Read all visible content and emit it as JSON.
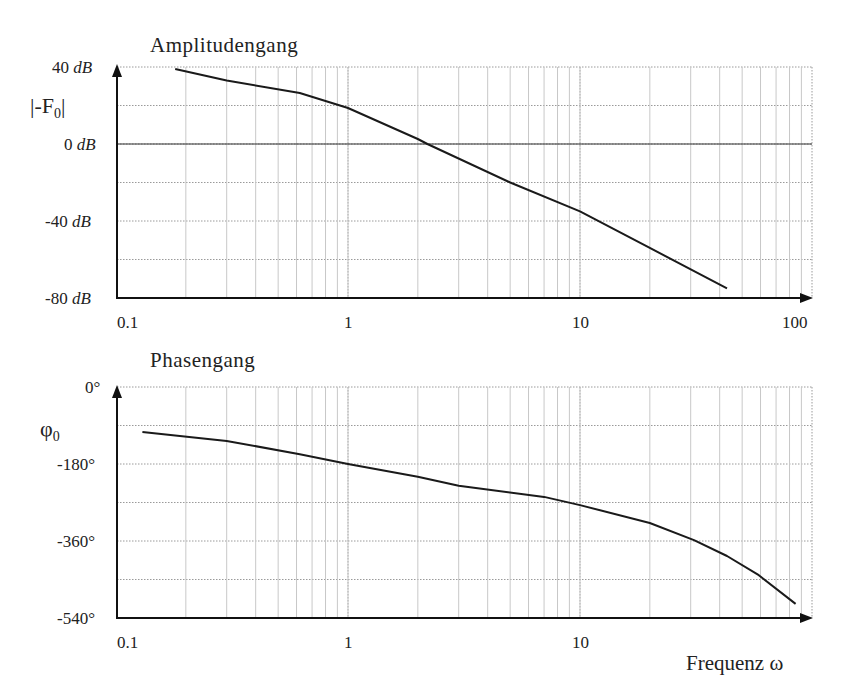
{
  "chart_data": [
    {
      "type": "line",
      "title": "Amplitudengang",
      "xlabel": "",
      "ylabel": "|-F0|",
      "xscale": "log",
      "xlim": [
        0.1,
        100
      ],
      "ylim": [
        -80,
        40
      ],
      "x_ticks": [
        "0.1",
        "1",
        "10",
        "100"
      ],
      "y_ticks": [
        "40 dB",
        "0 dB",
        "-40 dB",
        "-80 dB"
      ],
      "y_grid_step": 20,
      "grid": true,
      "series": [
        {
          "name": "|-F0| (dB)",
          "x": [
            0.18,
            0.3,
            0.62,
            1,
            2,
            2.2,
            5,
            10,
            20,
            43
          ],
          "values": [
            39,
            33,
            26.5,
            18.7,
            2.6,
            0,
            -20,
            -35,
            -54,
            -75
          ]
        }
      ]
    },
    {
      "type": "line",
      "title": "Phasengang",
      "xlabel": "Frequenz ω",
      "ylabel": "φ0",
      "xscale": "log",
      "xlim": [
        0.1,
        100
      ],
      "ylim": [
        -540,
        0
      ],
      "x_ticks": [
        "0.1",
        "1",
        "10"
      ],
      "y_ticks": [
        "0°",
        "-180°",
        "-360°",
        "-540°"
      ],
      "y_grid_step": 90,
      "grid": true,
      "series": [
        {
          "name": "φ0 (deg)",
          "x": [
            0.13,
            0.3,
            0.62,
            1,
            2,
            3,
            7,
            10,
            20,
            31,
            43,
            59,
            85
          ],
          "values": [
            -105,
            -126,
            -157,
            -180,
            -210,
            -231,
            -257,
            -276,
            -318,
            -358,
            -395,
            -440,
            -507
          ]
        }
      ]
    }
  ],
  "labels": {
    "amp_title": "Amplitudengang",
    "amp_ylabel_main": "|-F",
    "amp_ylabel_sub": "0",
    "amp_ylabel_close": "|",
    "amp_y40": "40",
    "amp_y0": "0",
    "amp_ym40": "-40",
    "amp_ym80": "-80",
    "db": "dB",
    "x01": "0.1",
    "x1": "1",
    "x10": "10",
    "x100": "100",
    "phase_title": "Phasengang",
    "phase_ylabel_main": "φ",
    "phase_ylabel_sub": "0",
    "ph_y0": "0°",
    "ph_ym180": "-180°",
    "ph_ym360": "-360°",
    "ph_ym540": "-540°",
    "xaxis_title": "Frequenz  ω"
  }
}
